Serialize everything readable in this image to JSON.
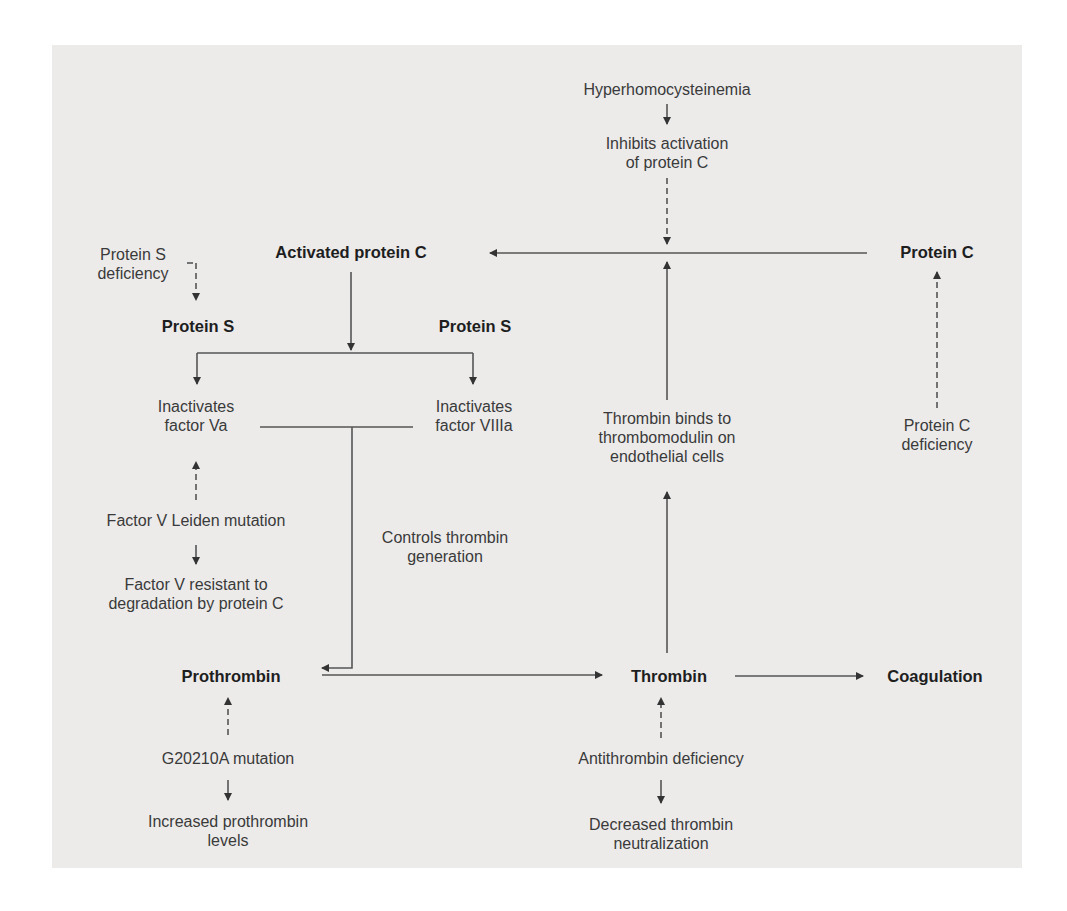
{
  "diagram": {
    "nodes": {
      "hyperhomocysteinemia": "Hyperhomocysteinemia",
      "inhibits_activation": "Inhibits activation\nof protein C",
      "activated_protein_c": "Activated protein C",
      "protein_c": "Protein C",
      "protein_s_deficiency": "Protein S\ndeficiency",
      "protein_s_left": "Protein S",
      "protein_s_right": "Protein S",
      "inactivates_va": "Inactivates\nfactor Va",
      "inactivates_viiia": "Inactivates\nfactor VIIIa",
      "thrombin_binds": "Thrombin binds to\nthrombomodulin on\nendothelial cells",
      "protein_c_deficiency": "Protein C\ndeficiency",
      "factor_v_leiden": "Factor V Leiden mutation",
      "factor_v_resistant": "Factor V resistant to\ndegradation by protein C",
      "controls_thrombin": "Controls thrombin\ngeneration",
      "prothrombin": "Prothrombin",
      "thrombin": "Thrombin",
      "coagulation": "Coagulation",
      "g20210a": "G20210A mutation",
      "increased_prothrombin": "Increased prothrombin\nlevels",
      "antithrombin_deficiency": "Antithrombin deficiency",
      "decreased_neutralization": "Decreased thrombin\nneutralization"
    },
    "colors": {
      "background": "#ecebea",
      "line": "#4a4a4a",
      "text": "#3a3a3a",
      "bold_text": "#1e1e1e"
    }
  }
}
